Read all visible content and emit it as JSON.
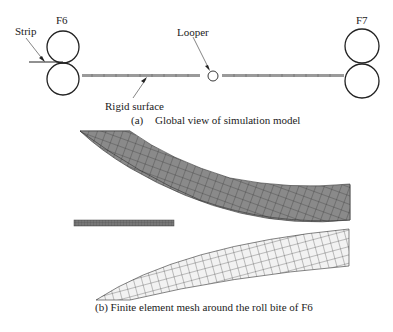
{
  "panel_a": {
    "labels": {
      "strip": "Strip",
      "f6": "F6",
      "looper": "Looper",
      "f7": "F7",
      "rigid_surface": "Rigid surface"
    },
    "caption_tag": "(a)",
    "caption_text": "Global view of simulation model"
  },
  "panel_b": {
    "caption": "(b) Finite element mesh around the roll bite of F6"
  },
  "colors": {
    "upper_roll_mesh": "#8a8a8a",
    "lower_roll_mesh": "#f0f0f0",
    "strip_mesh": "#6e6e6e",
    "lines": "#222222"
  }
}
